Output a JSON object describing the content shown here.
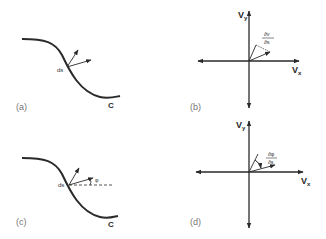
{
  "figure": {
    "panels": [
      {
        "id": "a",
        "label": "(a)",
        "curve_label": "C",
        "point_label": "ds"
      },
      {
        "id": "b",
        "label": "(b)",
        "x_axis": "V",
        "x_sub": "x",
        "y_axis": "V",
        "y_sub": "y",
        "vector_num": "∂v",
        "vector_den": "∂s"
      },
      {
        "id": "c",
        "label": "(c)",
        "curve_label": "C",
        "point_label": "ds",
        "angle_label": "φ"
      },
      {
        "id": "d",
        "label": "(d)",
        "x_axis": "V",
        "x_sub": "x",
        "y_axis": "V",
        "y_sub": "y",
        "vector_num": "∂φ",
        "vector_den": "∂s"
      }
    ],
    "colors": {
      "ink": "#2a2a2a",
      "label": "#777777",
      "background": "#ffffff"
    }
  }
}
